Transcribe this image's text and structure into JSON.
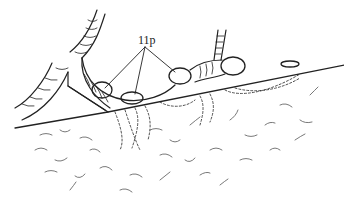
{
  "figure": {
    "type": "biological line drawing",
    "labels": [
      {
        "text": "11p",
        "x": 138,
        "y": 33
      }
    ],
    "colors": {
      "ink": "#222222",
      "background": "#ffffff"
    }
  }
}
